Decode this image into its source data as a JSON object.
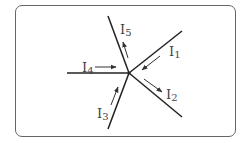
{
  "diagram": {
    "title": "",
    "node": {
      "x": 129,
      "y": 73,
      "label": ""
    },
    "colors": {
      "line": "#222222",
      "arrow": "#333333",
      "text": "#444444",
      "frame": "#666666"
    },
    "branches": [
      {
        "id": "I1",
        "label": "I",
        "sub": "1",
        "end": [
          182,
          31
        ],
        "direction": "into-node"
      },
      {
        "id": "I2",
        "label": "I",
        "sub": "2",
        "end": [
          182,
          117
        ],
        "direction": "out-of-node"
      },
      {
        "id": "I3",
        "label": "I",
        "sub": "3",
        "end": [
          108,
          129
        ],
        "direction": "into-node"
      },
      {
        "id": "I4",
        "label": "I",
        "sub": "4",
        "end": [
          67,
          73
        ],
        "direction": "into-node"
      },
      {
        "id": "I5",
        "label": "I",
        "sub": "5",
        "end": [
          108,
          16
        ],
        "direction": "out-of-node"
      }
    ]
  }
}
